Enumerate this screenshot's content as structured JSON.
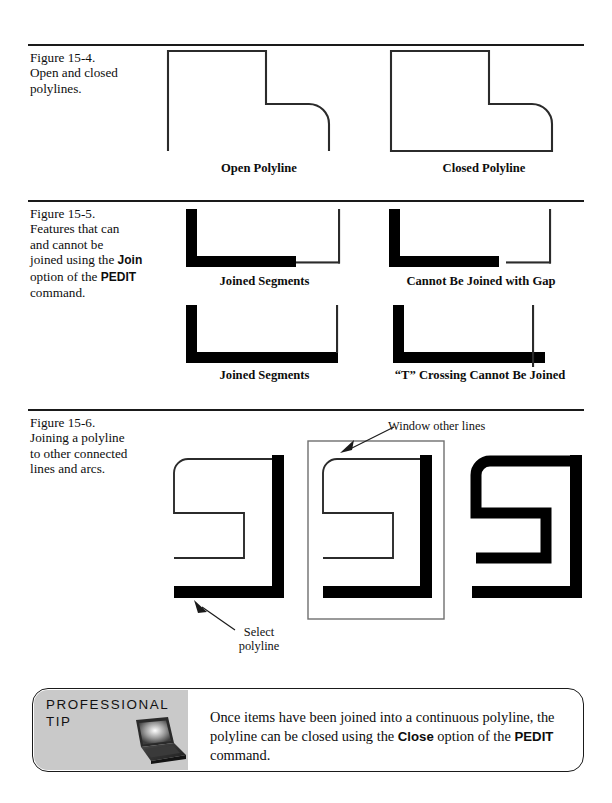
{
  "page": {
    "width": 612,
    "height": 803,
    "background": "#ffffff",
    "ink": "#1a1a1a"
  },
  "figures": [
    {
      "id": "figure-15-4",
      "number": "Figure 15-4.",
      "caption_lines": [
        "Open and closed",
        "polylines."
      ],
      "sub_labels": [
        "Open Polyline",
        "Closed Polyline"
      ]
    },
    {
      "id": "figure-15-5",
      "number": "Figure 15-5.",
      "caption_lines": [
        "Features that can",
        "and cannot be",
        "joined using the ",
        " option of the ",
        " command."
      ],
      "caption_bold_terms": [
        "Join",
        "PEDIT"
      ],
      "sub_labels": [
        "Joined Segments",
        "Cannot Be Joined with Gap",
        "Joined Segments",
        "“T” Crossing Cannot Be Joined"
      ]
    },
    {
      "id": "figure-15-6",
      "number": "Figure 15-6.",
      "caption_lines": [
        "Joining a polyline",
        "to other connected",
        "lines and arcs."
      ],
      "annotations": [
        {
          "name": "window-other-lines",
          "text": "Window other lines"
        },
        {
          "name": "select-polyline",
          "line1": "Select",
          "line2": "polyline"
        }
      ]
    }
  ],
  "professional_tip": {
    "heading_line1": "PROFESSIONAL",
    "heading_line2": "TIP",
    "icon": "laptop-icon",
    "body_prefix": "Once items have been joined into a continuous polyline, the polyline can be closed using the ",
    "body_bold1": "Close",
    "body_middle": " option of the ",
    "body_bold2": "PEDIT",
    "body_suffix": " command.",
    "panel_color": "#c9c9c9"
  }
}
